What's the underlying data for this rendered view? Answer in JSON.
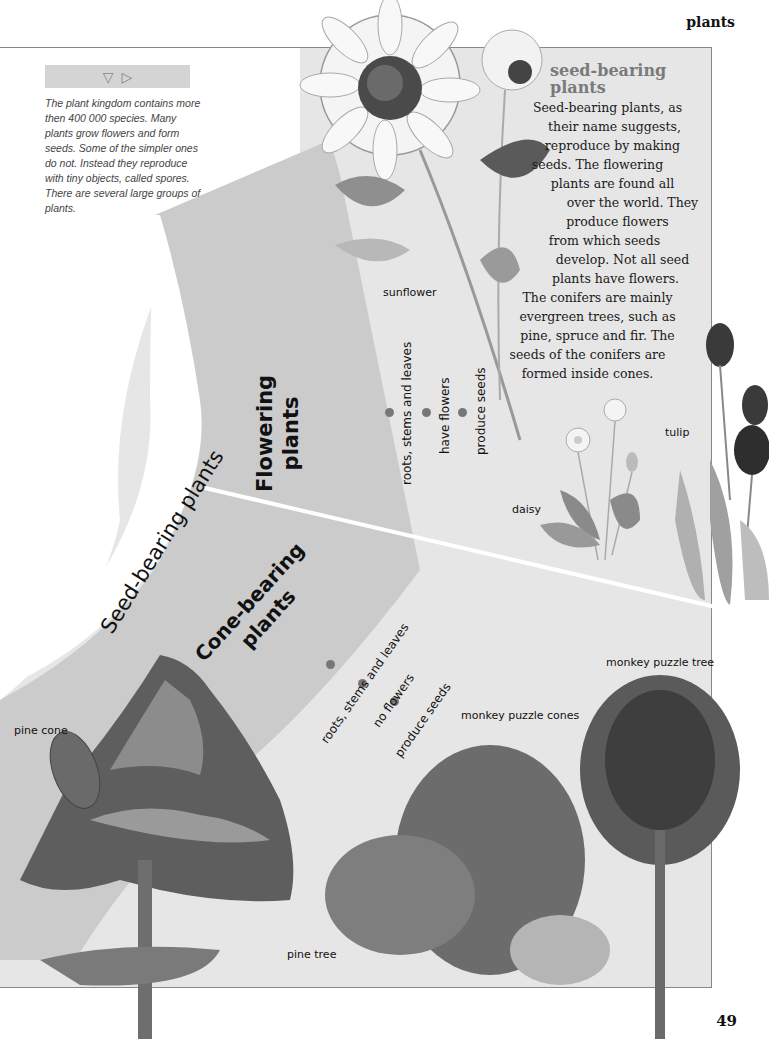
{
  "page": {
    "header_word": "plants",
    "page_number": "49"
  },
  "intro": {
    "nav_icons": [
      "triangle-down-icon",
      "triangle-right-icon"
    ],
    "nav_glyphs": [
      "▽",
      "▷"
    ],
    "text": "The plant kingdom contains more then 400 000 species. Many plants grow flowers and form seeds. Some of the simpler ones do not. Instead they reproduce with tiny objects, called spores. There are several large groups of plants."
  },
  "sidebar": {
    "title_line1": "seed-bearing",
    "title_line2": "plants",
    "body_lines": [
      "Seed-bearing plants, as",
      "their name suggests,",
      "reproduce by making",
      "seeds. The flowering",
      "plants are found all",
      "over the world. They",
      "produce flowers",
      "from which seeds",
      "develop. Not all seed",
      "plants have flowers.",
      "The conifers are mainly",
      "evergreen trees, such as",
      "pine, spruce and fir. The",
      "seeds of the conifers are",
      "formed inside cones."
    ]
  },
  "diagram": {
    "main_group": "Seed-bearing plants",
    "flowering": {
      "title_line1": "Flowering",
      "title_line2": "plants",
      "traits": [
        "roots, stems and leaves",
        "have flowers",
        "produce seeds"
      ]
    },
    "cone_bearing": {
      "title_line1": "Cone-bearing",
      "title_line2": "plants",
      "traits": [
        "roots, stems and leaves",
        "no flowers",
        "produce seeds"
      ]
    }
  },
  "illustrations": {
    "sunflower": "sunflower",
    "daisy": "daisy",
    "tulip": "tulip",
    "pine_cone": "pine cone",
    "pine_tree": "pine tree",
    "monkey_puzzle_cones": "monkey puzzle cones",
    "monkey_puzzle_tree": "monkey puzzle tree"
  },
  "colors": {
    "panel": "#e6e6e6",
    "outer_band": "#c8c8c8",
    "inner_band": "#d2d2d2",
    "dot": "#777777",
    "sidebar_title": "#7a7a7a"
  }
}
